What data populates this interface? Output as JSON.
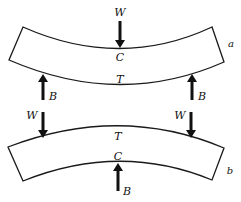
{
  "diagram": {
    "type": "beam-bending-forces",
    "beams": [
      {
        "id": "a",
        "tag": "a",
        "description": "Beam sagging downward; load W at center top, supports B at both ends underneath",
        "top_label": "C",
        "bottom_label": "T",
        "loads": [
          {
            "label": "W",
            "direction": "down",
            "position": "center-top"
          }
        ],
        "supports": [
          {
            "label": "B",
            "direction": "up",
            "position": "left-bottom"
          },
          {
            "label": "B",
            "direction": "up",
            "position": "right-bottom"
          }
        ]
      },
      {
        "id": "b",
        "tag": "b",
        "description": "Beam hogging upward; loads W at both ends on top, support B at center underneath",
        "top_label": "T",
        "bottom_label": "C",
        "loads": [
          {
            "label": "W",
            "direction": "down",
            "position": "left-top"
          },
          {
            "label": "W",
            "direction": "down",
            "position": "right-top"
          }
        ],
        "supports": [
          {
            "label": "B",
            "direction": "up",
            "position": "center-bottom"
          }
        ]
      }
    ],
    "colors": {
      "line": "#1a1a1a",
      "background": "#ffffff"
    }
  }
}
